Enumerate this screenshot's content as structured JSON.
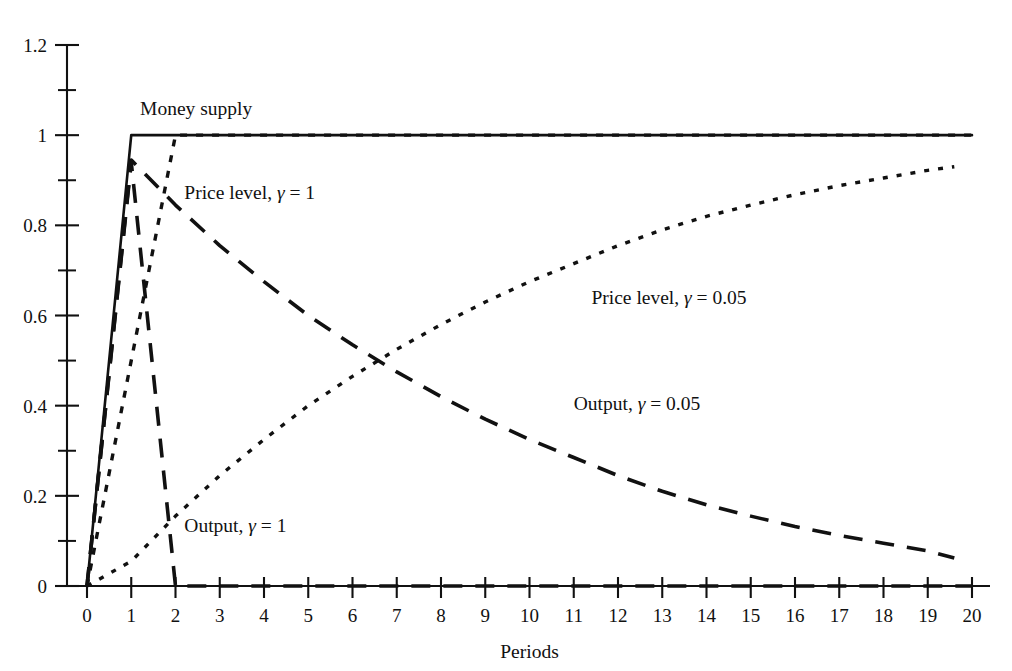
{
  "chart_data": {
    "type": "line",
    "title": "",
    "xlabel": "Periods",
    "ylabel": "",
    "xlim": [
      0,
      20
    ],
    "ylim": [
      0,
      1.2
    ],
    "grid": false,
    "legend_position": "inline-annotations",
    "x_ticks": [
      "0",
      "1",
      "2",
      "3",
      "4",
      "5",
      "6",
      "7",
      "8",
      "9",
      "10",
      "11",
      "12",
      "13",
      "14",
      "15",
      "16",
      "17",
      "18",
      "19",
      "20"
    ],
    "y_ticks": [
      "0",
      "0.2",
      "0.4",
      "0.6",
      "0.8",
      "1",
      "1.2"
    ],
    "y_minor_ticks": [
      0.1,
      0.3,
      0.5,
      0.7,
      0.9,
      1.1
    ],
    "series": [
      {
        "name": "Money supply",
        "style": "solid",
        "label": "Money supply",
        "label_x": 1.2,
        "label_y": 1.08,
        "x": [
          0,
          1,
          2,
          20
        ],
        "values": [
          0,
          1,
          1,
          1
        ]
      },
      {
        "name": "Price level, gamma = 1",
        "style": "short-dash",
        "label_prefix": "Price level, ",
        "label_symbol": "γ",
        "label_suffix": " = 1",
        "label_x": 2.2,
        "label_y": 0.895,
        "x": [
          0,
          1,
          2,
          20
        ],
        "values": [
          0,
          0.5,
          1,
          1
        ]
      },
      {
        "name": "Output, gamma = 1",
        "style": "long-dash",
        "label_prefix": "Output, ",
        "label_symbol": "γ",
        "label_suffix": " = 1",
        "label_x": 2.2,
        "label_y": 0.155,
        "x": [
          0,
          1,
          2,
          20
        ],
        "values": [
          0,
          0.94,
          0,
          0
        ]
      },
      {
        "name": "Price level, gamma = 0.05",
        "style": "dotted",
        "label_prefix": "Price level, ",
        "label_symbol": "γ",
        "label_suffix": " = 0.05",
        "label_x": 11.4,
        "label_y": 0.66,
        "x": [
          0,
          1,
          2,
          3,
          4,
          5,
          6,
          7,
          8,
          9,
          10,
          11,
          12,
          13,
          14,
          15,
          16,
          17,
          18,
          19,
          19.6
        ],
        "values": [
          0.0,
          0.055,
          0.155,
          0.245,
          0.325,
          0.4,
          0.465,
          0.525,
          0.58,
          0.63,
          0.675,
          0.715,
          0.755,
          0.79,
          0.82,
          0.845,
          0.868,
          0.888,
          0.905,
          0.922,
          0.93
        ]
      },
      {
        "name": "Output, gamma = 0.05",
        "style": "long-dash",
        "label_prefix": "Output, ",
        "label_symbol": "γ",
        "label_suffix": " = 0.05",
        "label_x": 11.0,
        "label_y": 0.425,
        "x": [
          0,
          1,
          2,
          3,
          4,
          5,
          6,
          7,
          8,
          9,
          10,
          11,
          12,
          13,
          14,
          15,
          16,
          17,
          18,
          19,
          19.6
        ],
        "values": [
          0.0,
          0.945,
          0.845,
          0.755,
          0.675,
          0.6,
          0.535,
          0.475,
          0.42,
          0.37,
          0.325,
          0.285,
          0.245,
          0.21,
          0.18,
          0.155,
          0.132,
          0.112,
          0.095,
          0.078,
          0.062
        ]
      }
    ]
  }
}
